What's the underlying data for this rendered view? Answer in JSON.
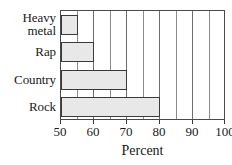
{
  "chart_data": {
    "type": "bar",
    "orientation": "horizontal",
    "title": "",
    "xlabel": "Percent",
    "ylabel": "",
    "categories": [
      "Heavy metal",
      "Rap",
      "Country",
      "Rock"
    ],
    "values": [
      55,
      60,
      70,
      80
    ],
    "xlim": [
      50,
      100
    ],
    "xticks": [
      50,
      60,
      70,
      80,
      90,
      100
    ],
    "xtick_labels": [
      "50",
      "60",
      "70",
      "80",
      "90",
      "100"
    ],
    "minor_tick_step": 5,
    "grid": true,
    "legend": false,
    "bars": [
      {
        "category": "Heavy metal",
        "label_line1": "Heavy",
        "label_line2": "metal",
        "value": 55
      },
      {
        "category": "Rap",
        "label_line1": "Rap",
        "label_line2": "",
        "value": 60
      },
      {
        "category": "Country",
        "label_line1": "Country",
        "label_line2": "",
        "value": 70
      },
      {
        "category": "Rock",
        "label_line1": "Rock",
        "label_line2": "",
        "value": 80
      }
    ],
    "colors": {
      "bar_fill": "#e8e8e8",
      "bar_border": "#3a3a3a",
      "grid": "#8c8c8c",
      "frame": "#4a4a4a",
      "background": "#ffffff",
      "text": "#1a1a1a"
    }
  }
}
